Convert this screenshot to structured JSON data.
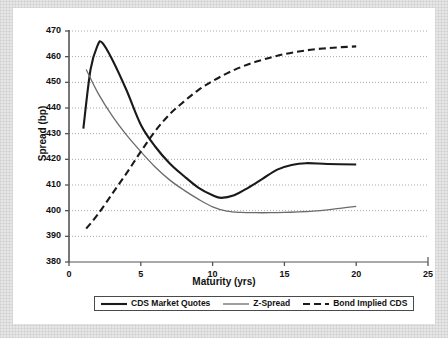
{
  "chart_data": {
    "type": "line",
    "title": "",
    "xlabel": "Maturity (yrs)",
    "ylabel": "Spread (bp)",
    "xlim": [
      0,
      25
    ],
    "ylim": [
      380,
      470
    ],
    "xticks": [
      0,
      5,
      10,
      15,
      20,
      25
    ],
    "yticks": [
      380,
      390,
      400,
      410,
      420,
      430,
      440,
      450,
      460,
      470
    ],
    "grid": "horizontal-dotted",
    "legend_position": "bottom-center",
    "series": [
      {
        "name": "CDS Market Quotes",
        "style": "solid",
        "color": "#1a1a1a",
        "width": 2.1,
        "x": [
          1,
          1.5,
          2,
          2.3,
          3,
          4,
          5,
          6,
          7,
          8,
          9,
          10,
          10.6,
          11.5,
          12.5,
          13.5,
          14.5,
          15.5,
          16.5,
          18,
          20
        ],
        "y": [
          432,
          455,
          464.5,
          465.5,
          459,
          447,
          433.5,
          425,
          418.5,
          413.5,
          409,
          406,
          405,
          406,
          409,
          412.5,
          416,
          417.8,
          418.5,
          418.2,
          418
        ]
      },
      {
        "name": "Z-Spread",
        "style": "solid",
        "color": "#6b6b6b",
        "width": 1.3,
        "x": [
          1.2,
          2,
          3,
          4,
          5,
          6,
          7,
          8,
          9,
          10,
          11,
          12,
          13,
          14,
          15,
          16,
          17,
          18,
          19,
          20
        ],
        "y": [
          455,
          446,
          437,
          429.5,
          423,
          417,
          412,
          408,
          404.5,
          401.5,
          399.8,
          399.3,
          399.2,
          399.2,
          399.3,
          399.5,
          399.8,
          400.3,
          401,
          401.7
        ]
      },
      {
        "name": "Bond Implied CDS",
        "style": "dashed",
        "color": "#1a1a1a",
        "width": 2.1,
        "x": [
          1.2,
          2,
          3,
          4,
          5,
          6,
          7,
          8,
          9,
          10,
          11,
          12,
          13,
          14,
          15,
          16,
          17,
          18,
          19,
          20
        ],
        "y": [
          393,
          398.5,
          406.5,
          414.5,
          423,
          431,
          437.5,
          442.5,
          447,
          450.5,
          453.5,
          456,
          458,
          459.6,
          461,
          462,
          462.8,
          463.3,
          463.7,
          464
        ]
      }
    ]
  },
  "legend": {
    "items": [
      {
        "label": "CDS Market Quotes",
        "style": "solid",
        "color": "#1a1a1a",
        "width": 2.1
      },
      {
        "label": "Z-Spread",
        "style": "solid",
        "color": "#6b6b6b",
        "width": 1.3
      },
      {
        "label": "Bond Implied CDS",
        "style": "dashed",
        "color": "#1a1a1a",
        "width": 2.1
      }
    ]
  },
  "colors": {
    "background": "#ffffff",
    "mat": "#e6e6e6",
    "axis": "#555555",
    "grid": "#a9a9a9",
    "text": "#111111"
  }
}
